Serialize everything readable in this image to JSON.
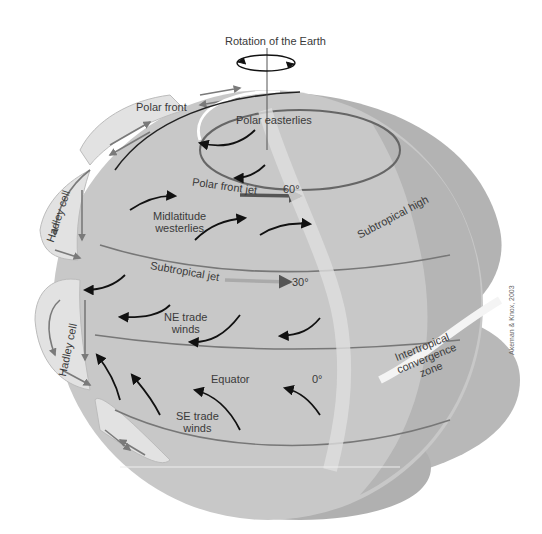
{
  "diagram": {
    "title": "Rotation of the Earth",
    "credit": "Akeman & Knox, 2003",
    "labels": {
      "rotation": "Rotation of the Earth",
      "polar_front": "Polar front",
      "polar_easterlies": "Polar easterlies",
      "polar_front_jet": "Polar front jet",
      "lat_60": "60°",
      "midlatitude_westerlies_1": "Midlatitude",
      "midlatitude_westerlies_2": "westerlies",
      "subtropical_high": "Subtropical high",
      "subtropical_jet": "Subtropical jet",
      "lat_30": "30°",
      "hadley_cell_upper": "Hadley cell",
      "hadley_cell_lower": "Hadley cell",
      "ne_trade_1": "NE trade",
      "ne_trade_2": "winds",
      "itcz_1": "Intertropical",
      "itcz_2": "convergence",
      "itcz_3": "zone",
      "equator": "Equator",
      "lat_0": "0°",
      "se_trade_1": "SE trade",
      "se_trade_2": "winds"
    },
    "colors": {
      "globe_fill": "#c8c8c8",
      "globe_dark": "#a9a9a9",
      "cell_fill": "#e2e2e2",
      "arrow_black": "#111111",
      "arrow_gray": "#7a7a7a",
      "jet_gray": "#8c8c8c",
      "text": "#3a3a3a"
    }
  }
}
